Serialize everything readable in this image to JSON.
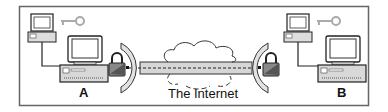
{
  "diagram": {
    "caption": "The Internet",
    "node_a_label": "A",
    "node_b_label": "B",
    "colors": {
      "frame": "#555555",
      "stroke": "#222222",
      "fill_light": "#e6e6e6",
      "fill_mid": "#c8c8c8",
      "key": "#b0b0b0"
    }
  }
}
